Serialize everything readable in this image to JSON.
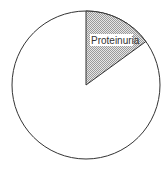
{
  "chart_data": {
    "type": "pie",
    "title": "",
    "slices": [
      {
        "label": "Proteinuria",
        "value": 15,
        "fill": "hatched-gray",
        "labeled": true
      },
      {
        "label": "",
        "value": 85,
        "fill": "#ffffff",
        "labeled": false
      }
    ],
    "start_angle_deg": 0,
    "direction": "clockwise",
    "legend": "none"
  },
  "labels": {
    "proteinuria": "Proteinuria"
  },
  "colors": {
    "outline": "#333333",
    "hatch": "#888888",
    "background": "#ffffff"
  }
}
